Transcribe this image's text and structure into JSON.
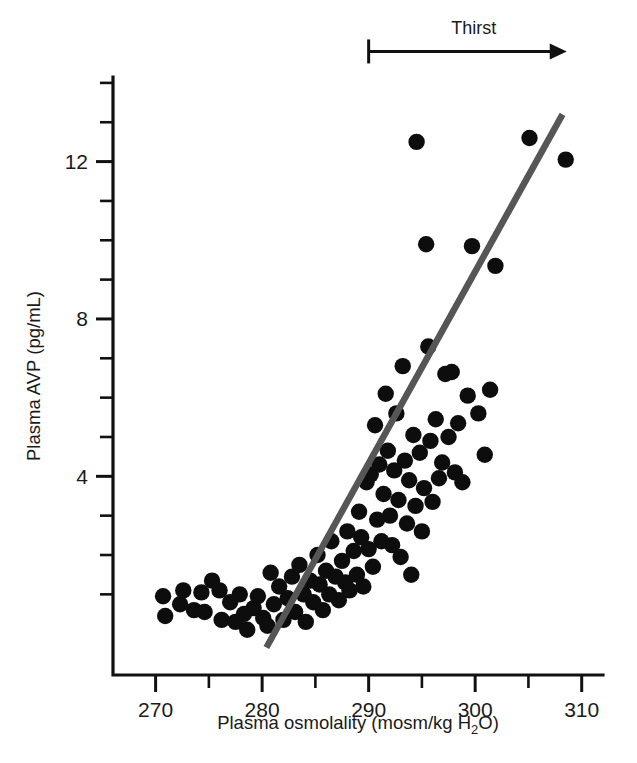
{
  "figure": {
    "title": "",
    "background_color": "#ffffff",
    "point_color": "#0d0d0d",
    "line_color": "#565656",
    "axis_color": "#111111"
  },
  "axes": {
    "x": {
      "label_prefix": "Plasma osmolality (mosm/kg H",
      "label_sub": "2",
      "label_suffix": "O)",
      "label_full": "Plasma osmolality (mosm/kg H2O)",
      "tick_labels": [
        "270",
        "280",
        "290",
        "300",
        "310"
      ],
      "tick_values": [
        270,
        280,
        290,
        300,
        310
      ],
      "minor_tick_values": [
        275,
        285,
        295,
        305
      ],
      "range": [
        266,
        312
      ]
    },
    "y": {
      "label": "Plasma AVP (pg/mL)",
      "tick_labels": [
        "4",
        "8",
        "12"
      ],
      "tick_values": [
        4,
        8,
        12
      ],
      "minor_tick_values": [
        1,
        2,
        3,
        5,
        6,
        7,
        9,
        10,
        11,
        13,
        14
      ],
      "range": [
        -1.05,
        14.15
      ]
    }
  },
  "annotations": [
    {
      "name": "thirst-arrow",
      "text": "Thirst",
      "start_x": 290,
      "end_x": 308.6,
      "y_level": 14.8,
      "arrow_direction": "right"
    }
  ],
  "chart_data": {
    "type": "scatter",
    "title": "",
    "xlabel": "Plasma osmolality (mosm/kg H2O)",
    "ylabel": "Plasma AVP (pg/mL)",
    "xlim": [
      266,
      312
    ],
    "ylim": [
      -1.05,
      14.15
    ],
    "grid": false,
    "legend": null,
    "marker": "filled-circle",
    "marker_radius_px": 8.2,
    "series": [
      {
        "name": "Plasma AVP observations",
        "color": "#0d0d0d",
        "points": [
          [
            270.7,
            0.95
          ],
          [
            270.9,
            0.45
          ],
          [
            272.3,
            0.75
          ],
          [
            272.6,
            1.1
          ],
          [
            273.6,
            0.6
          ],
          [
            274.3,
            1.05
          ],
          [
            274.6,
            0.55
          ],
          [
            275.3,
            1.35
          ],
          [
            276.0,
            1.1
          ],
          [
            276.2,
            0.35
          ],
          [
            277.0,
            0.8
          ],
          [
            277.5,
            0.3
          ],
          [
            277.9,
            1.0
          ],
          [
            278.3,
            0.5
          ],
          [
            278.6,
            0.1
          ],
          [
            279.2,
            0.65
          ],
          [
            279.6,
            0.95
          ],
          [
            280.1,
            0.4
          ],
          [
            280.5,
            0.2
          ],
          [
            280.8,
            1.55
          ],
          [
            281.1,
            0.75
          ],
          [
            281.6,
            1.2
          ],
          [
            282.0,
            0.35
          ],
          [
            282.4,
            0.9
          ],
          [
            282.8,
            1.45
          ],
          [
            283.1,
            0.55
          ],
          [
            283.5,
            1.75
          ],
          [
            283.9,
            1.0
          ],
          [
            284.1,
            0.3
          ],
          [
            284.5,
            1.35
          ],
          [
            284.8,
            0.8
          ],
          [
            285.2,
            2.0
          ],
          [
            285.4,
            1.25
          ],
          [
            285.7,
            0.6
          ],
          [
            286.0,
            1.6
          ],
          [
            286.3,
            1.0
          ],
          [
            286.5,
            2.35
          ],
          [
            286.9,
            1.45
          ],
          [
            287.2,
            0.85
          ],
          [
            287.5,
            1.85
          ],
          [
            287.8,
            1.3
          ],
          [
            288.0,
            2.6
          ],
          [
            288.2,
            1.1
          ],
          [
            288.6,
            2.1
          ],
          [
            288.9,
            1.5
          ],
          [
            289.1,
            3.1
          ],
          [
            289.3,
            2.45
          ],
          [
            289.5,
            1.2
          ],
          [
            289.8,
            3.85
          ],
          [
            290.0,
            2.15
          ],
          [
            290.2,
            4.05
          ],
          [
            290.4,
            1.7
          ],
          [
            290.6,
            5.3
          ],
          [
            290.8,
            2.9
          ],
          [
            291.0,
            4.3
          ],
          [
            291.2,
            2.35
          ],
          [
            291.4,
            3.55
          ],
          [
            291.6,
            6.1
          ],
          [
            291.8,
            4.65
          ],
          [
            292.0,
            3.0
          ],
          [
            292.2,
            2.25
          ],
          [
            292.4,
            4.15
          ],
          [
            292.6,
            5.6
          ],
          [
            292.8,
            3.4
          ],
          [
            293.0,
            1.95
          ],
          [
            293.2,
            6.8
          ],
          [
            293.4,
            4.4
          ],
          [
            293.6,
            2.8
          ],
          [
            293.8,
            3.9
          ],
          [
            294.0,
            1.5
          ],
          [
            294.2,
            5.05
          ],
          [
            294.4,
            3.25
          ],
          [
            294.5,
            12.5
          ],
          [
            294.8,
            4.6
          ],
          [
            295.0,
            2.6
          ],
          [
            295.2,
            3.7
          ],
          [
            295.4,
            9.9
          ],
          [
            295.6,
            7.3
          ],
          [
            295.8,
            4.9
          ],
          [
            296.0,
            3.35
          ],
          [
            296.3,
            5.45
          ],
          [
            296.6,
            3.95
          ],
          [
            296.9,
            4.35
          ],
          [
            297.2,
            6.6
          ],
          [
            297.5,
            5.0
          ],
          [
            297.8,
            6.65
          ],
          [
            298.1,
            4.1
          ],
          [
            298.4,
            5.35
          ],
          [
            298.8,
            3.85
          ],
          [
            299.3,
            6.05
          ],
          [
            299.7,
            9.85
          ],
          [
            300.3,
            5.6
          ],
          [
            300.9,
            4.55
          ],
          [
            301.4,
            6.2
          ],
          [
            301.9,
            9.35
          ],
          [
            305.1,
            12.6
          ],
          [
            308.5,
            12.05
          ]
        ]
      }
    ],
    "fit_line": {
      "name": "regression line",
      "color": "#565656",
      "x_start": 280.4,
      "y_start": -0.35,
      "x_end": 308.2,
      "y_end": 13.2
    },
    "n_points": 99
  }
}
